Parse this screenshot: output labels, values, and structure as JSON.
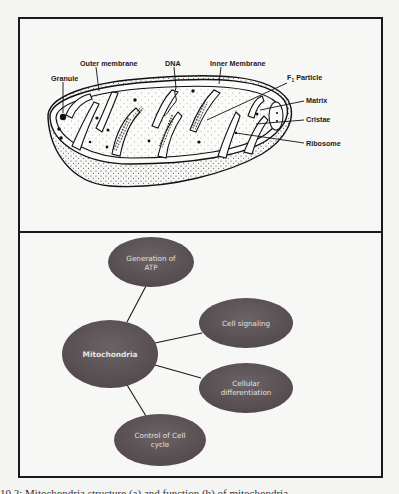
{
  "figure": {
    "top_panel": {
      "title": "Mitochondrion structure",
      "labels": {
        "granule": "Granule",
        "outer_membrane": "Outer membrane",
        "dna": "DNA",
        "inner_membrane": "Inner Membrane",
        "f1_particle_prefix": "F",
        "f1_particle_sub": "1",
        "f1_particle_suffix": " Particle",
        "matrix": "Matrix",
        "cristae": "Cristae",
        "ribosome": "Ribosome"
      }
    },
    "bottom_panel": {
      "center_node": "Mitochondria",
      "nodes": [
        {
          "line1": "Generation of",
          "line2": "ATP"
        },
        {
          "line1": "Cell signaling",
          "line2": ""
        },
        {
          "line1": "Cellular",
          "line2": "differentiation"
        },
        {
          "line1": "Control of Cell",
          "line2": "cycle"
        }
      ],
      "node_color": "#5e5658",
      "line_color": "#1a1a1a"
    },
    "caption": "10.2: Mitochondria structure (a) and function (b) of mitochondria"
  }
}
